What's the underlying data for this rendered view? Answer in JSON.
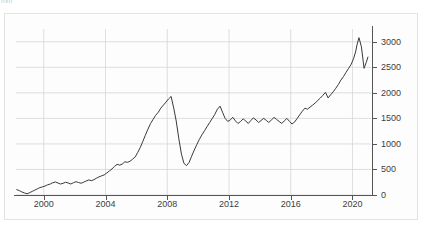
{
  "figure": {
    "clipped_top_label": "mm",
    "background_color": "#fdfdfd",
    "frame_color": "#e3e3e3"
  },
  "chart_data": {
    "type": "line",
    "title": "",
    "subtitle": "",
    "xlabel": "",
    "ylabel": "",
    "xlim": [
      1998.2,
      2021.2
    ],
    "ylim": [
      0,
      3250
    ],
    "grid": true,
    "legend": null,
    "line_color": "#3a3a3a",
    "grid_color": "#d6d6d6",
    "axis_color": "#555555",
    "y_ticks": [
      0,
      500,
      1000,
      1500,
      2000,
      2500,
      3000
    ],
    "y_tick_labels": [
      "0",
      "500",
      "1000",
      "1500",
      "2000",
      "2500",
      "3000"
    ],
    "y_axis_position": "right",
    "x_ticks": [
      2000,
      2004,
      2008,
      2012,
      2016,
      2020
    ],
    "x_tick_labels": [
      "2000",
      "2004",
      "2008",
      "2012",
      "2016",
      "2020"
    ],
    "x_gridlines": [
      2000,
      2004,
      2008,
      2012,
      2016,
      2020
    ],
    "series": [
      {
        "name": "index",
        "x": [
          1998.25,
          1998.42,
          1998.58,
          1998.75,
          1998.92,
          1999.08,
          1999.25,
          1999.42,
          1999.58,
          1999.75,
          1999.92,
          2000.08,
          2000.25,
          2000.42,
          2000.58,
          2000.75,
          2000.92,
          2001.08,
          2001.25,
          2001.42,
          2001.58,
          2001.75,
          2001.92,
          2002.08,
          2002.25,
          2002.42,
          2002.58,
          2002.75,
          2002.92,
          2003.08,
          2003.25,
          2003.42,
          2003.58,
          2003.75,
          2003.92,
          2004.08,
          2004.25,
          2004.42,
          2004.58,
          2004.75,
          2004.92,
          2005.08,
          2005.25,
          2005.42,
          2005.58,
          2005.75,
          2005.92,
          2006.08,
          2006.25,
          2006.42,
          2006.58,
          2006.75,
          2006.92,
          2007.08,
          2007.25,
          2007.42,
          2007.58,
          2007.75,
          2007.92,
          2008.08,
          2008.25,
          2008.42,
          2008.58,
          2008.75,
          2008.92,
          2009.08,
          2009.25,
          2009.42,
          2009.58,
          2009.75,
          2009.92,
          2010.08,
          2010.25,
          2010.42,
          2010.58,
          2010.75,
          2010.92,
          2011.08,
          2011.25,
          2011.42,
          2011.58,
          2011.75,
          2011.92,
          2012.08,
          2012.25,
          2012.42,
          2012.58,
          2012.75,
          2012.92,
          2013.08,
          2013.25,
          2013.42,
          2013.58,
          2013.75,
          2013.92,
          2014.08,
          2014.25,
          2014.42,
          2014.58,
          2014.75,
          2014.92,
          2015.08,
          2015.25,
          2015.42,
          2015.58,
          2015.75,
          2015.92,
          2016.08,
          2016.25,
          2016.42,
          2016.58,
          2016.75,
          2016.92,
          2017.08,
          2017.25,
          2017.42,
          2017.58,
          2017.75,
          2017.92,
          2018.08,
          2018.25,
          2018.42,
          2018.58,
          2018.75,
          2018.92,
          2019.08,
          2019.25,
          2019.42,
          2019.58,
          2019.75,
          2019.92,
          2020.08,
          2020.2,
          2020.3,
          2020.42,
          2020.58,
          2020.75,
          2020.92,
          2021.0
        ],
        "values": [
          105,
          85,
          60,
          40,
          25,
          45,
          70,
          95,
          120,
          145,
          160,
          175,
          200,
          215,
          240,
          255,
          235,
          215,
          230,
          250,
          235,
          215,
          240,
          260,
          245,
          230,
          250,
          275,
          295,
          280,
          300,
          330,
          355,
          375,
          395,
          430,
          470,
          510,
          560,
          600,
          585,
          605,
          650,
          640,
          660,
          700,
          745,
          830,
          930,
          1050,
          1170,
          1290,
          1400,
          1480,
          1560,
          1620,
          1700,
          1760,
          1820,
          1880,
          1930,
          1700,
          1450,
          1100,
          800,
          620,
          575,
          640,
          760,
          880,
          990,
          1090,
          1180,
          1260,
          1340,
          1420,
          1500,
          1580,
          1680,
          1740,
          1620,
          1500,
          1440,
          1470,
          1520,
          1450,
          1400,
          1440,
          1490,
          1450,
          1400,
          1460,
          1510,
          1470,
          1420,
          1460,
          1500,
          1460,
          1420,
          1470,
          1520,
          1480,
          1440,
          1400,
          1450,
          1500,
          1440,
          1390,
          1430,
          1500,
          1570,
          1640,
          1700,
          1680,
          1720,
          1760,
          1800,
          1850,
          1900,
          1950,
          2010,
          1900,
          1960,
          2020,
          2090,
          2160,
          2250,
          2320,
          2400,
          2480,
          2560,
          2680,
          2800,
          2950,
          3080,
          2900,
          2480,
          2620,
          2700
        ]
      }
    ],
    "annotations": [],
    "data_range": {
      "min_value": 25,
      "max_value": 3080,
      "start_year": 1998,
      "end_year": 2021
    }
  }
}
